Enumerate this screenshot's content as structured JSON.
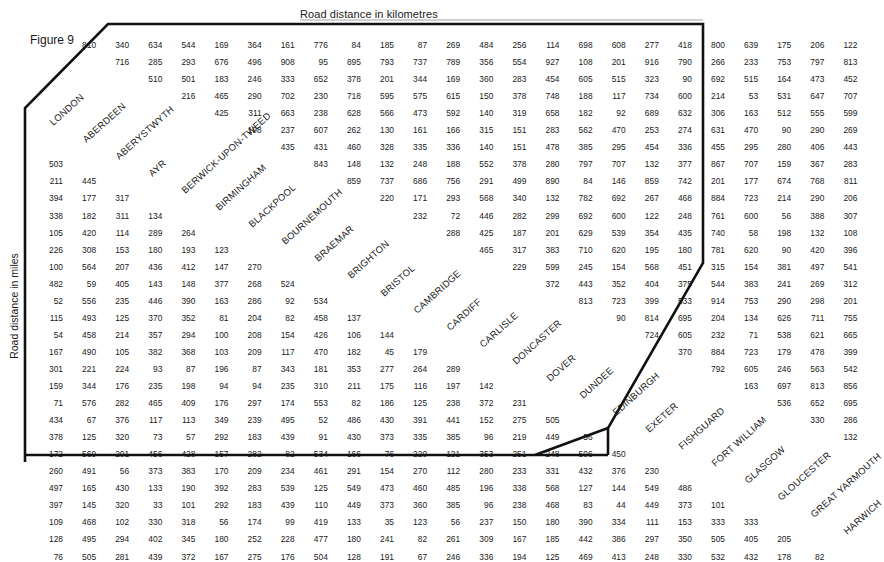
{
  "titles": {
    "top": "Road distance in kilometres",
    "side": "Road distance in miles",
    "figure": "Figure 9"
  },
  "cities": [
    "LONDON",
    "ABERDEEN",
    "ABERYSTWYTH",
    "AYR",
    "BERWICK-UPON-TWEED",
    "BIRMINGHAM",
    "BLACKPOOL",
    "BOURNEMOUTH",
    "BRAEMAR",
    "BRIGHTON",
    "BRISTOL",
    "CAMBRIDGE",
    "CARDIFF",
    "CARLISLE",
    "DONCASTER",
    "DOVER",
    "DUNDEE",
    "EDINBURGH",
    "EXETER",
    "FISHGUARD",
    "FORT WILLIAM",
    "GLASGOW",
    "GLOUCESTER",
    "GREAT YARMOUTH",
    "HARWICH"
  ],
  "chart_data": {
    "type": "table",
    "title": "Figure 9",
    "subtitle_top": "Road distance in kilometres",
    "subtitle_side": "Road distance in miles",
    "labels": [
      "LONDON",
      "ABERDEEN",
      "ABERYSTWYTH",
      "AYR",
      "BERWICK-UPON-TWEED",
      "BIRMINGHAM",
      "BLACKPOOL",
      "BOURNEMOUTH",
      "BRAEMAR",
      "BRIGHTON",
      "BRISTOL",
      "CAMBRIDGE",
      "CARDIFF",
      "CARLISLE",
      "DONCASTER",
      "DOVER",
      "DUNDEE",
      "EDINBURGH",
      "EXETER",
      "FISHGUARD",
      "FORT WILLIAM",
      "GLASGOW",
      "GLOUCESTER",
      "GREAT YARMOUTH",
      "HARWICH"
    ],
    "km_rows": [
      [
        810,
        340,
        634,
        544,
        169,
        364,
        161,
        776,
        84,
        185,
        87,
        269,
        484,
        256,
        114,
        698,
        608,
        277,
        418,
        800,
        639,
        175,
        206,
        122
      ],
      [
        716,
        285,
        293,
        676,
        496,
        908,
        95,
        895,
        793,
        737,
        789,
        356,
        554,
        927,
        108,
        201,
        916,
        790,
        266,
        233,
        753,
        797,
        813
      ],
      [
        510,
        501,
        183,
        246,
        333,
        652,
        378,
        201,
        344,
        169,
        360,
        283,
        454,
        605,
        515,
        323,
        90,
        692,
        515,
        164,
        473,
        452
      ],
      [
        216,
        465,
        290,
        702,
        230,
        718,
        595,
        575,
        615,
        150,
        378,
        748,
        188,
        117,
        734,
        600,
        214,
        53,
        531,
        647,
        707
      ],
      [
        425,
        311,
        663,
        238,
        628,
        566,
        473,
        592,
        140,
        319,
        658,
        182,
        92,
        689,
        632,
        306,
        163,
        512,
        555,
        599
      ],
      [
        198,
        237,
        607,
        262,
        130,
        161,
        166,
        315,
        151,
        283,
        562,
        470,
        253,
        274,
        631,
        470,
        90,
        290,
        269
      ],
      [
        435,
        431,
        460,
        328,
        335,
        336,
        140,
        151,
        478,
        385,
        295,
        454,
        336,
        455,
        295,
        280,
        406,
        443
      ],
      [
        843,
        148,
        132,
        248,
        188,
        552,
        378,
        280,
        797,
        707,
        132,
        377,
        867,
        707,
        159,
        367,
        283
      ],
      [
        859,
        737,
        686,
        756,
        291,
        499,
        890,
        84,
        146,
        859,
        742,
        201,
        177,
        674,
        768,
        811
      ],
      [
        220,
        171,
        293,
        568,
        340,
        132,
        782,
        692,
        267,
        468,
        884,
        723,
        214,
        290,
        206
      ],
      [
        232,
        72,
        446,
        282,
        299,
        692,
        600,
        122,
        248,
        761,
        600,
        56,
        388,
        307
      ],
      [
        288,
        425,
        187,
        201,
        629,
        539,
        354,
        435,
        740,
        58,
        198,
        132,
        108
      ],
      [
        465,
        317,
        383,
        710,
        620,
        195,
        180,
        781,
        620,
        90,
        420,
        396
      ],
      [
        229,
        599,
        245,
        154,
        568,
        451,
        315,
        154,
        381,
        497,
        541
      ],
      [
        372,
        443,
        352,
        404,
        375,
        544,
        383,
        241,
        269,
        312
      ],
      [
        813,
        723,
        399,
        533,
        914,
        753,
        290,
        298,
        201
      ],
      [
        90,
        814,
        695,
        204,
        134,
        626,
        711,
        755
      ],
      [
        724,
        605,
        232,
        71,
        538,
        621,
        665
      ],
      [
        370,
        884,
        723,
        179,
        478,
        399
      ],
      [
        792,
        605,
        246,
        563,
        542
      ],
      [
        163,
        697,
        813,
        856
      ],
      [
        536,
        652,
        695
      ],
      [
        330,
        286
      ],
      [
        132
      ]
    ],
    "mile_rows": [
      [
        503
      ],
      [
        211,
        445
      ],
      [
        394,
        177,
        317
      ],
      [
        338,
        182,
        311,
        134
      ],
      [
        105,
        420,
        114,
        289,
        264
      ],
      [
        226,
        308,
        153,
        180,
        193,
        123
      ],
      [
        100,
        564,
        207,
        436,
        412,
        147,
        270
      ],
      [
        482,
        59,
        405,
        143,
        148,
        377,
        268,
        524
      ],
      [
        52,
        556,
        235,
        446,
        390,
        163,
        286,
        92,
        534
      ],
      [
        115,
        493,
        125,
        370,
        352,
        81,
        204,
        82,
        458,
        137
      ],
      [
        54,
        458,
        214,
        357,
        294,
        100,
        208,
        154,
        426,
        106,
        144
      ],
      [
        167,
        490,
        105,
        382,
        368,
        103,
        209,
        117,
        470,
        182,
        45,
        179
      ],
      [
        301,
        221,
        224,
        93,
        87,
        196,
        87,
        343,
        181,
        353,
        277,
        264,
        289
      ],
      [
        159,
        344,
        176,
        235,
        198,
        94,
        94,
        235,
        310,
        211,
        175,
        116,
        197,
        142
      ],
      [
        71,
        576,
        282,
        465,
        409,
        176,
        297,
        174,
        553,
        82,
        186,
        125,
        238,
        372,
        231
      ],
      [
        434,
        67,
        376,
        117,
        113,
        349,
        239,
        495,
        52,
        486,
        430,
        391,
        441,
        152,
        275,
        505
      ],
      [
        378,
        125,
        320,
        73,
        57,
        292,
        183,
        439,
        91,
        430,
        373,
        335,
        385,
        96,
        219,
        449,
        56
      ],
      [
        172,
        569,
        201,
        456,
        428,
        157,
        282,
        82,
        534,
        166,
        76,
        220,
        121,
        353,
        251,
        248,
        506,
        450
      ],
      [
        260,
        491,
        56,
        373,
        383,
        170,
        209,
        234,
        461,
        291,
        154,
        270,
        112,
        280,
        233,
        331,
        432,
        376,
        230
      ],
      [
        497,
        165,
        430,
        133,
        190,
        392,
        283,
        539,
        125,
        549,
        473,
        460,
        485,
        196,
        338,
        568,
        127,
        144,
        549,
        486
      ],
      [
        397,
        145,
        320,
        33,
        101,
        292,
        183,
        439,
        110,
        449,
        373,
        360,
        385,
        96,
        238,
        468,
        83,
        44,
        449,
        373,
        101
      ],
      [
        109,
        468,
        102,
        330,
        318,
        56,
        174,
        99,
        419,
        133,
        35,
        123,
        56,
        237,
        150,
        180,
        390,
        334,
        111,
        153,
        333,
        333
      ],
      [
        128,
        495,
        294,
        402,
        345,
        180,
        252,
        228,
        477,
        180,
        241,
        82,
        261,
        309,
        167,
        185,
        442,
        386,
        297,
        350,
        505,
        405,
        205
      ],
      [
        76,
        505,
        281,
        439,
        372,
        167,
        275,
        176,
        504,
        128,
        191,
        67,
        246,
        336,
        194,
        125,
        469,
        413,
        248,
        330,
        532,
        432,
        178,
        82
      ]
    ]
  }
}
